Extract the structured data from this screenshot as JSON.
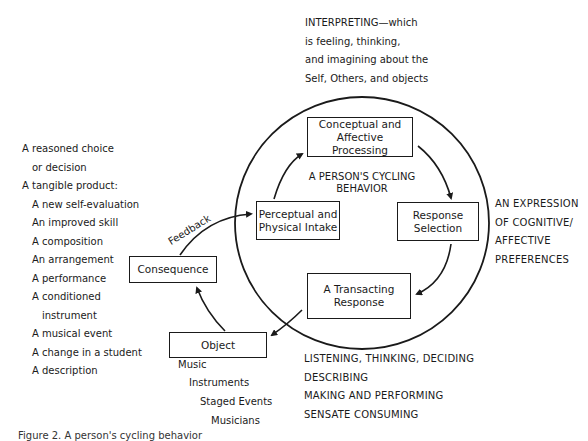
{
  "diagram": {
    "center_title": [
      "A PERSON'S CYCLING",
      "BEHAVIOR"
    ],
    "nodes": {
      "conceptual": [
        "Conceptual and",
        "Affective",
        "Processing"
      ],
      "response_selection": [
        "Response",
        "Selection"
      ],
      "transacting": [
        "A Transacting",
        "Response"
      ],
      "perceptual": [
        "Perceptual and",
        "Physical Intake"
      ],
      "object": "Object",
      "consequence": "Consequence"
    },
    "edge_labels": {
      "feedback": "Feedback"
    },
    "annotations": {
      "interpreting": [
        "INTERPRETING—which",
        "is feeling, thinking,",
        "and imagining about the",
        "Self, Others, and objects"
      ],
      "expression": [
        "AN EXPRESSION",
        "OF COGNITIVE/",
        "AFFECTIVE",
        "PREFERENCES"
      ],
      "transacting_modes": [
        "LISTENING, THINKING, DECIDING",
        "DESCRIBING",
        "MAKING AND PERFORMING",
        "SENSATE CONSUMING"
      ],
      "object_examples": [
        "Music",
        "Instruments",
        "Staged Events",
        "Musicians"
      ],
      "consequence_examples": [
        {
          "text": "A reasoned choice",
          "indent": 0
        },
        {
          "text": "or decision",
          "indent": 1
        },
        {
          "text": "A tangible product:",
          "indent": 0
        },
        {
          "text": "A new self-evaluation",
          "indent": 1
        },
        {
          "text": "An improved skill",
          "indent": 1
        },
        {
          "text": "A composition",
          "indent": 1
        },
        {
          "text": "An arrangement",
          "indent": 1
        },
        {
          "text": "A performance",
          "indent": 1
        },
        {
          "text": "A conditioned",
          "indent": 1
        },
        {
          "text": "instrument",
          "indent": 2
        },
        {
          "text": "A musical event",
          "indent": 1
        },
        {
          "text": "A change in a student",
          "indent": 1
        },
        {
          "text": "A description",
          "indent": 1
        }
      ]
    },
    "caption": "Figure 2. A person's cycling behavior"
  }
}
